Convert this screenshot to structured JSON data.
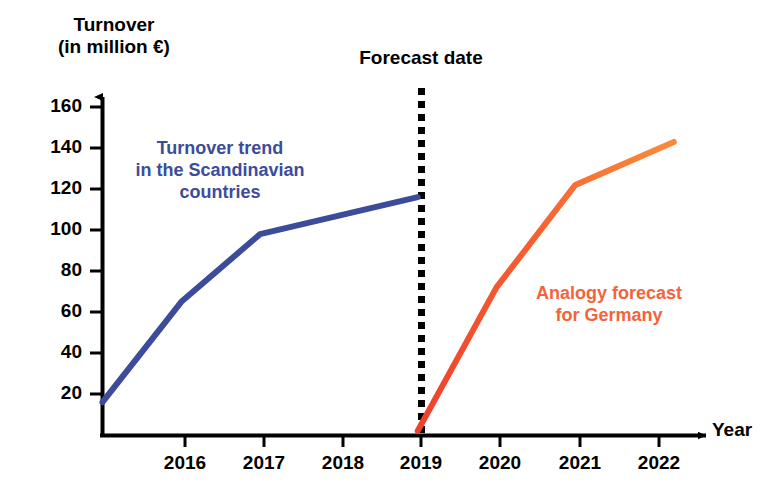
{
  "chart_data": {
    "type": "line",
    "title": "",
    "ylabel_line1": "Turnover",
    "ylabel_line2": "(in million €)",
    "xlabel": "Year",
    "xlim": [
      2015,
      2022.6
    ],
    "ylim": [
      0,
      168
    ],
    "yticks": [
      20,
      40,
      60,
      80,
      100,
      120,
      140,
      160
    ],
    "xticks": [
      2016,
      2017,
      2018,
      2019,
      2020,
      2021,
      2022
    ],
    "grid": false,
    "legend_position": "inline-annotations",
    "series": [
      {
        "name": "Turnover trend in the Scandinavian countries",
        "color": "#3c4c9b",
        "x": [
          2015.0,
          2016.0,
          2017.0,
          2019.0
        ],
        "values": [
          16,
          65,
          98,
          116
        ]
      },
      {
        "name": "Analogy forecast for Germany",
        "color": "#f4542e",
        "x": [
          2019.0,
          2020.0,
          2021.0,
          2022.25
        ],
        "values": [
          2,
          72,
          122,
          143
        ]
      }
    ],
    "annotations": [
      {
        "name": "forecast-date",
        "text": "Forecast date",
        "x": 2019,
        "style": "vertical dotted black line",
        "color": "#000000"
      },
      {
        "name": "scandinavia-label",
        "text_lines": [
          "Turnover trend",
          "in the Scandinavian",
          "countries"
        ],
        "color": "#3c4c9b"
      },
      {
        "name": "germany-label",
        "text_lines": [
          "Analogy forecast",
          "for Germany"
        ],
        "color": "#f4542e"
      }
    ]
  },
  "axes": {
    "y_title_line1": "Turnover",
    "y_title_line2": "(in million €)",
    "x_title": "Year",
    "y_tick_labels": [
      "160",
      "140",
      "120",
      "100",
      "80",
      "60",
      "40",
      "20"
    ],
    "x_tick_labels": [
      "2016",
      "2017",
      "2018",
      "2019",
      "2020",
      "2021",
      "2022"
    ]
  },
  "labels": {
    "forecast_date": "Forecast date",
    "scandinavia_line1": "Turnover trend",
    "scandinavia_line2": "in the Scandinavian",
    "scandinavia_line3": "countries",
    "germany_line1": "Analogy forecast",
    "germany_line2": "for Germany"
  },
  "colors": {
    "scandinavia": "#3c4c9b",
    "germany": "#f4542e",
    "axis": "#000000",
    "background": "#ffffff"
  }
}
